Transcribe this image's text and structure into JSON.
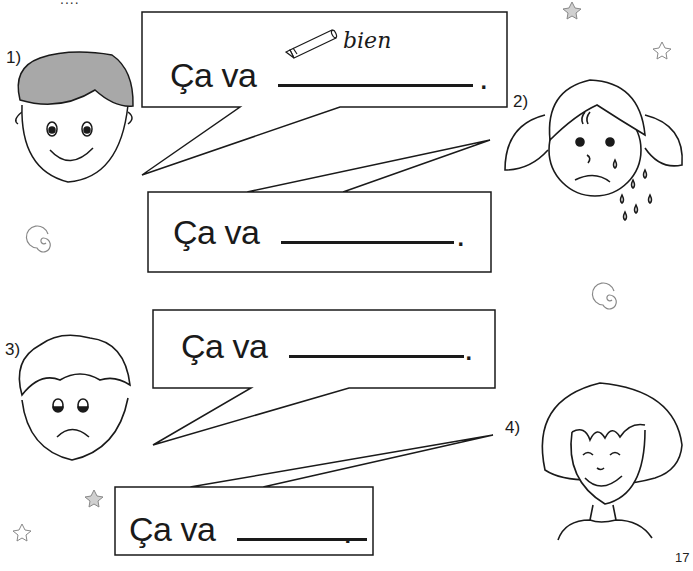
{
  "page": {
    "page_number": "17",
    "header_cutoff_text": "...."
  },
  "exercises": [
    {
      "number": "1)",
      "prompt": "Ça va",
      "punctuation": ".",
      "example_answer": "bien",
      "face": "happy boy"
    },
    {
      "number": "2)",
      "prompt": "Ça va",
      "punctuation": ".",
      "face": "crying girl"
    },
    {
      "number": "3)",
      "prompt": "Ça va",
      "punctuation": ".",
      "face": "sad boy"
    },
    {
      "number": "4)",
      "prompt": "Ça va",
      "punctuation": ".",
      "face": "smiling child"
    }
  ],
  "icons": {
    "pencil": "pencil-icon",
    "star": "star-icon",
    "spiral": "spiral-icon"
  },
  "colors": {
    "ink": "#1a1a1a",
    "hair_fill": "#a8a8a8",
    "star_fill": "#d0d0d0",
    "background": "#ffffff"
  }
}
